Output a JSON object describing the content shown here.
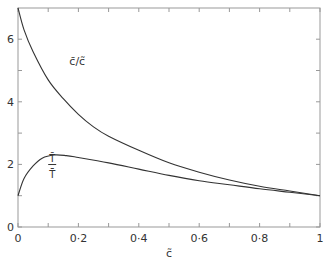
{
  "chart_data": {
    "type": "line",
    "title": "",
    "xlabel": "c̃",
    "ylabel": "",
    "xlim": [
      0,
      1
    ],
    "ylim": [
      0,
      7
    ],
    "grid": false,
    "x_ticks": [
      "0",
      "0·2",
      "0·4",
      "0·6",
      "0·8",
      "1"
    ],
    "y_ticks": [
      "0",
      "2",
      "4",
      "6"
    ],
    "series": [
      {
        "name": "c̄/c̃",
        "x": [
          0,
          0.02,
          0.05,
          0.1,
          0.15,
          0.2,
          0.25,
          0.3,
          0.4,
          0.5,
          0.6,
          0.7,
          0.8,
          0.9,
          1.0
        ],
        "values": [
          7.0,
          6.3,
          5.6,
          4.7,
          4.1,
          3.6,
          3.2,
          2.9,
          2.45,
          2.05,
          1.75,
          1.5,
          1.3,
          1.15,
          1.0
        ]
      },
      {
        "name": "T̄/T̄̄",
        "x": [
          0,
          0.02,
          0.05,
          0.08,
          0.12,
          0.16,
          0.2,
          0.3,
          0.4,
          0.5,
          0.6,
          0.7,
          0.8,
          0.9,
          1.0
        ],
        "values": [
          1.0,
          1.55,
          1.95,
          2.2,
          2.3,
          2.28,
          2.22,
          2.05,
          1.85,
          1.65,
          1.48,
          1.35,
          1.22,
          1.11,
          1.0
        ]
      }
    ],
    "annotations": [
      {
        "text": "c̄/c̃",
        "x": 0.17,
        "y": 5.3
      },
      {
        "text": "T̄/T̄̄",
        "x": 0.1,
        "y": 1.9
      }
    ]
  }
}
